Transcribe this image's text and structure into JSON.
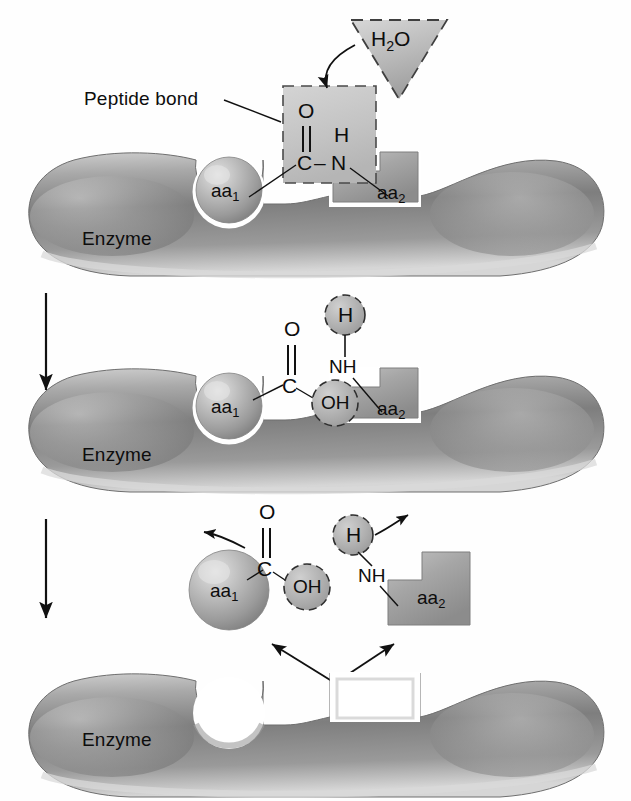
{
  "figure": {
    "background_color": "#ffffff",
    "ink_color": "#0d0d0d",
    "enzyme_fill": "#8e8e8e",
    "substrate_fill": "#a8a8a8",
    "highlight_box_fill": "#c9c9c9"
  },
  "labels": {
    "peptide_bond": "Peptide bond",
    "enzyme": "Enzyme",
    "water": "H",
    "water_sub": "2",
    "water_tail": "O",
    "aa1_base": "aa",
    "aa1_sub": "1",
    "aa2_base": "aa",
    "aa2_sub": "2",
    "atom_oxygen": "O",
    "atom_carbon": "C",
    "atom_nitrogen": "N",
    "atom_hydrogen": "H",
    "group_nh": "NH",
    "group_oh": "OH",
    "bond_dash": "–"
  },
  "panels": [
    {
      "id": "panel-1",
      "step": 1,
      "caption": "Substrate bound: peptide bond in active site, water approaches",
      "enzyme_label": "Enzyme",
      "substrates": [
        "aa1",
        "aa2"
      ],
      "reactant": "H2O",
      "highlight": "Peptide bond",
      "chem_labels": [
        "O",
        "C",
        "N",
        "H"
      ],
      "has_dashed_box": true,
      "has_water_triangle": true
    },
    {
      "id": "panel-2",
      "step": 2,
      "caption": "Water adds across the bond: OH to carbonyl carbon, H to nitrogen",
      "enzyme_label": "Enzyme",
      "substrates": [
        "aa1",
        "aa2"
      ],
      "chem_labels": [
        "O",
        "C",
        "OH",
        "H",
        "NH"
      ],
      "has_dashed_circles": true
    },
    {
      "id": "panel-3",
      "step": 3,
      "caption": "Products released and enzyme active site free",
      "enzyme_label": "Enzyme",
      "substrates": [
        "aa1",
        "aa2"
      ],
      "chem_labels": [
        "O",
        "C",
        "OH",
        "H",
        "NH"
      ],
      "has_release_arrows": true,
      "has_product_arrows": true
    }
  ],
  "step_arrows": [
    {
      "from_step": 1,
      "to_step": 2,
      "direction": "down"
    },
    {
      "from_step": 2,
      "to_step": 3,
      "direction": "down"
    }
  ]
}
